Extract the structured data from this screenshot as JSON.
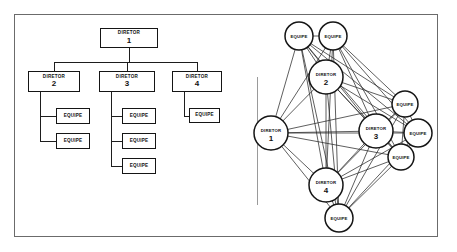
{
  "figure": {
    "border_color": "#6b6b6b",
    "node_color": "#151515",
    "background": "#ffffff"
  },
  "org_chart": {
    "title": "",
    "nodes": [
      {
        "id": "d1",
        "role": "DIRETOR",
        "number": "1",
        "x": 100,
        "y": 28,
        "w": 58,
        "h": 20,
        "type": "director"
      },
      {
        "id": "d2",
        "role": "DIRETOR",
        "number": "2",
        "x": 28,
        "y": 71,
        "w": 52,
        "h": 21,
        "type": "director"
      },
      {
        "id": "d3",
        "role": "DIRETOR",
        "number": "3",
        "x": 99,
        "y": 71,
        "w": 56,
        "h": 21,
        "type": "director"
      },
      {
        "id": "d4",
        "role": "DIRETOR",
        "number": "4",
        "x": 172,
        "y": 71,
        "w": 50,
        "h": 21,
        "type": "director"
      },
      {
        "id": "e2a",
        "role": "EQUIPE",
        "number": "",
        "x": 56,
        "y": 108,
        "w": 34,
        "h": 16,
        "type": "team"
      },
      {
        "id": "e2b",
        "role": "EQUIPE",
        "number": "",
        "x": 56,
        "y": 133,
        "w": 34,
        "h": 16,
        "type": "team"
      },
      {
        "id": "e3a",
        "role": "EQUIPE",
        "number": "",
        "x": 122,
        "y": 108,
        "w": 34,
        "h": 16,
        "type": "team"
      },
      {
        "id": "e3b",
        "role": "EQUIPE",
        "number": "",
        "x": 122,
        "y": 133,
        "w": 34,
        "h": 16,
        "type": "team"
      },
      {
        "id": "e3c",
        "role": "EQUIPE",
        "number": "",
        "x": 122,
        "y": 158,
        "w": 34,
        "h": 16,
        "type": "team"
      },
      {
        "id": "e4a",
        "role": "EQUIPE",
        "number": "",
        "x": 189,
        "y": 108,
        "w": 31,
        "h": 15,
        "type": "team"
      }
    ]
  },
  "network": {
    "nodes": [
      {
        "id": "n_eq_t1",
        "role": "EQUIPE",
        "number": "",
        "cx": 57,
        "cy": 36,
        "r": 14,
        "type": "team"
      },
      {
        "id": "n_eq_t2",
        "role": "EQUIPE",
        "number": "",
        "cx": 91,
        "cy": 36,
        "r": 14,
        "type": "team"
      },
      {
        "id": "n_d2",
        "role": "DIRETOR",
        "number": "2",
        "cx": 84,
        "cy": 77,
        "r": 17,
        "type": "director"
      },
      {
        "id": "n_d1",
        "role": "DIRETOR",
        "number": "1",
        "cx": 29,
        "cy": 133,
        "r": 17,
        "type": "director"
      },
      {
        "id": "n_d3",
        "role": "DIRETOR",
        "number": "3",
        "cx": 134,
        "cy": 131,
        "r": 17,
        "type": "director"
      },
      {
        "id": "n_d4",
        "role": "DIRETOR",
        "number": "4",
        "cx": 84,
        "cy": 185,
        "r": 17,
        "type": "director"
      },
      {
        "id": "n_eq_r1",
        "role": "EQUIPE",
        "number": "",
        "cx": 163,
        "cy": 104,
        "r": 13,
        "type": "team"
      },
      {
        "id": "n_eq_r2",
        "role": "EQUIPE",
        "number": "",
        "cx": 176,
        "cy": 133,
        "r": 14,
        "type": "team"
      },
      {
        "id": "n_eq_r3",
        "role": "EQUIPE",
        "number": "",
        "cx": 159,
        "cy": 157,
        "r": 13,
        "type": "team"
      },
      {
        "id": "n_eq_b",
        "role": "EQUIPE",
        "number": "",
        "cx": 97,
        "cy": 218,
        "r": 14,
        "type": "team"
      }
    ],
    "edges": [
      [
        "n_eq_t1",
        "n_eq_t2"
      ],
      [
        "n_eq_t1",
        "n_d2"
      ],
      [
        "n_eq_t1",
        "n_d1"
      ],
      [
        "n_eq_t1",
        "n_d3"
      ],
      [
        "n_eq_t1",
        "n_d4"
      ],
      [
        "n_eq_t1",
        "n_eq_r1"
      ],
      [
        "n_eq_t1",
        "n_eq_r2"
      ],
      [
        "n_eq_t1",
        "n_eq_r3"
      ],
      [
        "n_eq_t1",
        "n_eq_b"
      ],
      [
        "n_eq_t2",
        "n_d2"
      ],
      [
        "n_eq_t2",
        "n_d1"
      ],
      [
        "n_eq_t2",
        "n_d3"
      ],
      [
        "n_eq_t2",
        "n_d4"
      ],
      [
        "n_eq_t2",
        "n_eq_r1"
      ],
      [
        "n_eq_t2",
        "n_eq_r2"
      ],
      [
        "n_eq_t2",
        "n_eq_r3"
      ],
      [
        "n_eq_t2",
        "n_eq_b"
      ],
      [
        "n_d2",
        "n_d1"
      ],
      [
        "n_d2",
        "n_d3"
      ],
      [
        "n_d2",
        "n_d4"
      ],
      [
        "n_d2",
        "n_eq_r1"
      ],
      [
        "n_d2",
        "n_eq_r2"
      ],
      [
        "n_d2",
        "n_eq_r3"
      ],
      [
        "n_d2",
        "n_eq_b"
      ],
      [
        "n_d1",
        "n_d3"
      ],
      [
        "n_d1",
        "n_d4"
      ],
      [
        "n_d1",
        "n_eq_r1"
      ],
      [
        "n_d1",
        "n_eq_r2"
      ],
      [
        "n_d1",
        "n_eq_r3"
      ],
      [
        "n_d1",
        "n_eq_b"
      ],
      [
        "n_d3",
        "n_d4"
      ],
      [
        "n_d3",
        "n_eq_r1"
      ],
      [
        "n_d3",
        "n_eq_r2"
      ],
      [
        "n_d3",
        "n_eq_r3"
      ],
      [
        "n_d3",
        "n_eq_b"
      ],
      [
        "n_d4",
        "n_eq_r1"
      ],
      [
        "n_d4",
        "n_eq_r2"
      ],
      [
        "n_d4",
        "n_eq_r3"
      ],
      [
        "n_d4",
        "n_eq_b"
      ],
      [
        "n_eq_r1",
        "n_eq_r2"
      ],
      [
        "n_eq_r1",
        "n_eq_r3"
      ],
      [
        "n_eq_r1",
        "n_eq_b"
      ],
      [
        "n_eq_r2",
        "n_eq_r3"
      ],
      [
        "n_eq_r2",
        "n_eq_b"
      ],
      [
        "n_eq_r3",
        "n_eq_b"
      ]
    ]
  }
}
